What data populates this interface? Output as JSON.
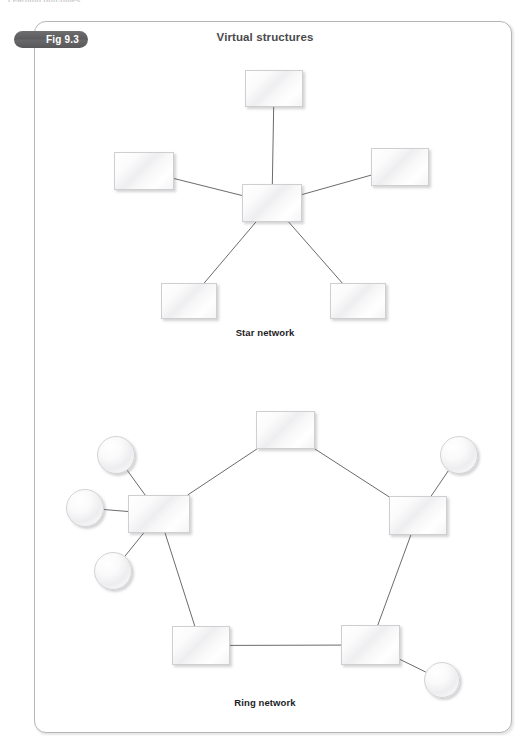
{
  "page": {
    "running_header": "Learning outcomes",
    "width": 530,
    "height": 754,
    "background": "#ffffff"
  },
  "figure": {
    "badge_label": "Fig 9.3",
    "badge_color": "#5b5b5d",
    "title": "Virtual structures",
    "frame": {
      "x": 34,
      "y": 21,
      "width": 478,
      "height": 712,
      "border_color": "#b6b6ba",
      "corner_radius": 12
    }
  },
  "diagram_data": {
    "type": "node-link-diagram",
    "connector_color": "#6b6b70",
    "connector_width": 1,
    "node_fill": "#f3f3f5",
    "node_border": "#cfcfd2",
    "sections": [
      {
        "id": "star-network",
        "caption": "Star network",
        "topology": "star",
        "node_count": 6,
        "edge_count": 5,
        "nodes": [
          {
            "id": "star-hub",
            "shape": "rect",
            "role": "hub",
            "x": 242,
            "y": 184,
            "width": 60,
            "height": 38
          },
          {
            "id": "star-spoke-top",
            "shape": "rect",
            "role": "satellite",
            "x": 245,
            "y": 70,
            "width": 58,
            "height": 37
          },
          {
            "id": "star-spoke-left",
            "shape": "rect",
            "role": "satellite",
            "x": 114,
            "y": 152,
            "width": 60,
            "height": 38
          },
          {
            "id": "star-spoke-right",
            "shape": "rect",
            "role": "satellite",
            "x": 371,
            "y": 148,
            "width": 58,
            "height": 38
          },
          {
            "id": "star-spoke-bottom-left",
            "shape": "rect",
            "role": "satellite",
            "x": 161,
            "y": 283,
            "width": 56,
            "height": 36
          },
          {
            "id": "star-spoke-bottom-right",
            "shape": "rect",
            "role": "satellite",
            "x": 330,
            "y": 283,
            "width": 56,
            "height": 36
          }
        ],
        "edges": [
          {
            "from": "star-hub",
            "to": "star-spoke-top"
          },
          {
            "from": "star-hub",
            "to": "star-spoke-left"
          },
          {
            "from": "star-hub",
            "to": "star-spoke-right"
          },
          {
            "from": "star-hub",
            "to": "star-spoke-bottom-left"
          },
          {
            "from": "star-hub",
            "to": "star-spoke-bottom-right"
          }
        ]
      },
      {
        "id": "ring-network",
        "caption": "Ring network",
        "topology": "ring",
        "node_count": 10,
        "edge_count": 10,
        "nodes": [
          {
            "id": "ring-box-top",
            "shape": "rect",
            "role": "ring-node",
            "x": 256,
            "y": 411,
            "width": 59,
            "height": 38
          },
          {
            "id": "ring-box-left",
            "shape": "rect",
            "role": "ring-node",
            "x": 128,
            "y": 495,
            "width": 62,
            "height": 38
          },
          {
            "id": "ring-box-right",
            "shape": "rect",
            "role": "ring-node",
            "x": 389,
            "y": 496,
            "width": 58,
            "height": 39
          },
          {
            "id": "ring-box-bottom-left",
            "shape": "rect",
            "role": "ring-node",
            "x": 172,
            "y": 626,
            "width": 58,
            "height": 39
          },
          {
            "id": "ring-box-bottom-right",
            "shape": "rect",
            "role": "ring-node",
            "x": 341,
            "y": 625,
            "width": 59,
            "height": 40
          },
          {
            "id": "ring-circle-left-top",
            "shape": "circle",
            "role": "leaf",
            "x": 97,
            "y": 436,
            "diameter": 38
          },
          {
            "id": "ring-circle-left-middle",
            "shape": "circle",
            "role": "leaf",
            "x": 66,
            "y": 489,
            "diameter": 38
          },
          {
            "id": "ring-circle-left-bottom",
            "shape": "circle",
            "role": "leaf",
            "x": 94,
            "y": 552,
            "diameter": 38
          },
          {
            "id": "ring-circle-right-top",
            "shape": "circle",
            "role": "leaf",
            "x": 440,
            "y": 436,
            "diameter": 38
          },
          {
            "id": "ring-circle-bottom-right",
            "shape": "circle",
            "role": "leaf",
            "x": 424,
            "y": 662,
            "diameter": 36
          }
        ],
        "edges": [
          {
            "from": "ring-box-top",
            "to": "ring-box-left"
          },
          {
            "from": "ring-box-top",
            "to": "ring-box-right"
          },
          {
            "from": "ring-box-left",
            "to": "ring-box-bottom-left"
          },
          {
            "from": "ring-box-right",
            "to": "ring-box-bottom-right"
          },
          {
            "from": "ring-box-bottom-left",
            "to": "ring-box-bottom-right"
          },
          {
            "from": "ring-box-left",
            "to": "ring-circle-left-top"
          },
          {
            "from": "ring-box-left",
            "to": "ring-circle-left-middle"
          },
          {
            "from": "ring-box-left",
            "to": "ring-circle-left-bottom"
          },
          {
            "from": "ring-box-right",
            "to": "ring-circle-right-top"
          },
          {
            "from": "ring-box-bottom-right",
            "to": "ring-circle-bottom-right"
          }
        ]
      }
    ]
  }
}
